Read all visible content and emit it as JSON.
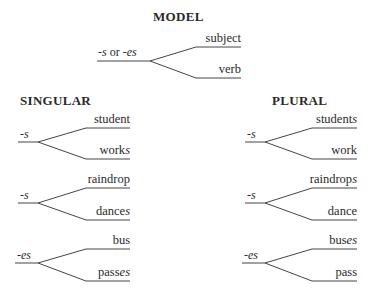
{
  "model": {
    "heading": "MODEL",
    "suffix_a": "-s",
    "suffix_or": " or ",
    "suffix_b": "-es",
    "top": "subject",
    "bottom": "verb"
  },
  "singular": {
    "heading": "SINGULAR",
    "groups": [
      {
        "suffix": "-s",
        "top_base": "student",
        "top_end": "",
        "bottom_base": "work",
        "bottom_end": "s"
      },
      {
        "suffix": "-s",
        "top_base": "raindrop",
        "top_end": "",
        "bottom_base": "dance",
        "bottom_end": "s"
      },
      {
        "suffix": "-es",
        "top_base": "bus",
        "top_end": "",
        "bottom_base": "pass",
        "bottom_end": "es"
      }
    ]
  },
  "plural": {
    "heading": "PLURAL",
    "groups": [
      {
        "suffix": "-s",
        "top_base": "student",
        "top_end": "s",
        "bottom_base": "work",
        "bottom_end": ""
      },
      {
        "suffix": "-s",
        "top_base": "raindrop",
        "top_end": "s",
        "bottom_base": "dance",
        "bottom_end": ""
      },
      {
        "suffix": "-es",
        "top_base": "bus",
        "top_end": "es",
        "bottom_base": "pass",
        "bottom_end": ""
      }
    ]
  }
}
